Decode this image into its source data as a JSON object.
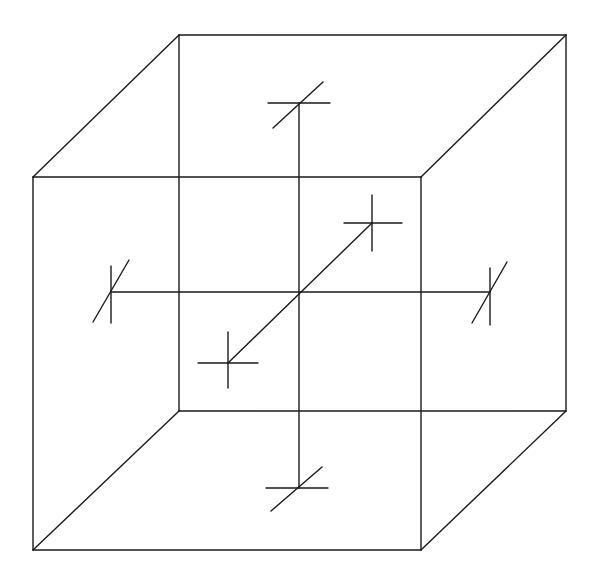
{
  "diagram": {
    "title": "",
    "stroke_color": "#1a1a1a",
    "background": "#ffffff",
    "cube": {
      "front_face": {
        "tl": [
          33,
          177
        ],
        "tr": [
          421,
          177
        ],
        "br": [
          421,
          550
        ],
        "bl": [
          33,
          550
        ]
      },
      "back_face": {
        "tl": [
          179,
          35
        ],
        "tr": [
          566,
          35
        ],
        "br": [
          566,
          411
        ],
        "bl": [
          179,
          411
        ]
      }
    },
    "center": [
      299,
      292
    ],
    "axes": [
      {
        "name": "vertical",
        "from": [
          299,
          103
        ],
        "to": [
          299,
          488
        ]
      },
      {
        "name": "horizontal",
        "from": [
          111,
          292
        ],
        "to": [
          490,
          292
        ]
      },
      {
        "name": "depth",
        "from": [
          228,
          363
        ],
        "to": [
          372,
          223
        ]
      }
    ],
    "end_markers": [
      {
        "axis": "vertical",
        "end": "top",
        "at": [
          299,
          103
        ],
        "segments": [
          [
            [
              268,
              103
            ],
            [
              330,
              103
            ]
          ],
          [
            [
              273,
              128
            ],
            [
              323,
              82
            ]
          ]
        ]
      },
      {
        "axis": "vertical",
        "end": "bottom",
        "at": [
          299,
          488
        ],
        "segments": [
          [
            [
              266,
              488
            ],
            [
              328,
              488
            ]
          ],
          [
            [
              271,
              511
            ],
            [
              322,
              467
            ]
          ]
        ]
      },
      {
        "axis": "horizontal",
        "end": "left",
        "at": [
          111,
          292
        ],
        "segments": [
          [
            [
              111,
              266
            ],
            [
              111,
              323
            ]
          ],
          [
            [
              93,
              322
            ],
            [
              129,
              260
            ]
          ]
        ]
      },
      {
        "axis": "horizontal",
        "end": "right",
        "at": [
          490,
          292
        ],
        "segments": [
          [
            [
              490,
              268
            ],
            [
              490,
              325
            ]
          ],
          [
            [
              472,
              323
            ],
            [
              507,
              262
            ]
          ]
        ]
      },
      {
        "axis": "depth",
        "end": "front",
        "at": [
          228,
          363
        ],
        "segments": [
          [
            [
              198,
              363
            ],
            [
              258,
              363
            ]
          ],
          [
            [
              228,
              332
            ],
            [
              228,
              388
            ]
          ]
        ]
      },
      {
        "axis": "depth",
        "end": "back",
        "at": [
          372,
          223
        ],
        "segments": [
          [
            [
              344,
              223
            ],
            [
              402,
              223
            ]
          ],
          [
            [
              372,
              195
            ],
            [
              372,
              251
            ]
          ]
        ]
      }
    ]
  }
}
